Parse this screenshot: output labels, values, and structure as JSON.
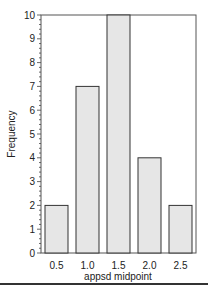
{
  "chart_data": {
    "type": "bar",
    "title": "",
    "xlabel": "appsd midpoint",
    "ylabel": "Frequency",
    "categories": [
      "0.5",
      "1.0",
      "1.5",
      "2.0",
      "2.5"
    ],
    "values": [
      2,
      7,
      10,
      4,
      2
    ],
    "ylim": [
      0,
      10
    ],
    "yticks": [
      "0",
      "1",
      "2",
      "3",
      "4",
      "5",
      "6",
      "7",
      "8",
      "9",
      "10"
    ],
    "grid": false,
    "legend": null,
    "bar_color": "#e6e6e6",
    "bar_edge_color": "#333333"
  }
}
